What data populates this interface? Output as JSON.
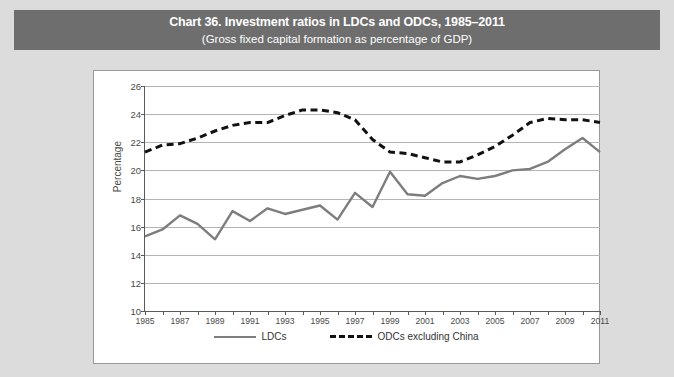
{
  "header": {
    "title": "Chart 36. Investment ratios in LDCs and ODCs, 1985–2011",
    "subtitle": "(Gross fixed capital formation as percentage of GDP)"
  },
  "colors": {
    "title_band": "#6e6e6e",
    "page_background": "#dcdcdc",
    "plot_background": "#ffffff",
    "gridline": "#b4b4b4",
    "ldcs_line": "#7d7d7d",
    "odcs_line": "#111111"
  },
  "chart_data": {
    "type": "line",
    "title": "Chart 36. Investment ratios in LDCs and ODCs, 1985–2011",
    "subtitle": "(Gross fixed capital formation as percentage of GDP)",
    "xlabel": "",
    "ylabel": "Percentage",
    "ylim": [
      10,
      26
    ],
    "ytick_step": 2,
    "yticks": [
      10,
      12,
      14,
      16,
      18,
      20,
      22,
      24,
      26
    ],
    "xlim": [
      1985,
      2011
    ],
    "x": [
      1985,
      1986,
      1987,
      1988,
      1989,
      1990,
      1991,
      1992,
      1993,
      1994,
      1995,
      1996,
      1997,
      1998,
      1999,
      2000,
      2001,
      2002,
      2003,
      2004,
      2005,
      2006,
      2007,
      2008,
      2009,
      2010,
      2011
    ],
    "xticks": [
      1985,
      1986,
      1987,
      1988,
      1989,
      1990,
      1991,
      1992,
      1993,
      1994,
      1995,
      1996,
      1997,
      1998,
      1999,
      2000,
      2001,
      2002,
      2003,
      2004,
      2005,
      2006,
      2007,
      2008,
      2009,
      2010,
      2011
    ],
    "xtick_labels": [
      "1985",
      "",
      "1987",
      "",
      "1989",
      "",
      "1991",
      "",
      "1993",
      "",
      "1995",
      "",
      "1997",
      "",
      "1999",
      "",
      "2001",
      "",
      "2003",
      "",
      "2005",
      "",
      "2007",
      "",
      "2009",
      "",
      "2011"
    ],
    "grid": true,
    "legend_position": "bottom",
    "series": [
      {
        "name": "LDCs",
        "style": "solid",
        "color": "#7d7d7d",
        "values": [
          15.3,
          15.8,
          16.8,
          16.2,
          15.1,
          17.1,
          16.4,
          17.3,
          16.9,
          17.2,
          17.5,
          16.5,
          18.4,
          17.4,
          19.9,
          18.3,
          18.2,
          19.1,
          19.6,
          19.4,
          19.6,
          20.0,
          20.1,
          20.6,
          21.5,
          22.3,
          21.3
        ]
      },
      {
        "name": "ODCs excluding China",
        "style": "dashed",
        "color": "#111111",
        "values": [
          21.3,
          21.8,
          21.9,
          22.3,
          22.8,
          23.2,
          23.4,
          23.4,
          23.9,
          24.3,
          24.3,
          24.1,
          23.6,
          22.2,
          21.3,
          21.2,
          20.9,
          20.6,
          20.6,
          21.1,
          21.7,
          22.5,
          23.4,
          23.7,
          23.6,
          23.6,
          23.4
        ]
      }
    ]
  },
  "legend": {
    "items": [
      {
        "label": "LDCs",
        "style": "solid"
      },
      {
        "label": "ODCs excluding China",
        "style": "dashed"
      }
    ]
  }
}
